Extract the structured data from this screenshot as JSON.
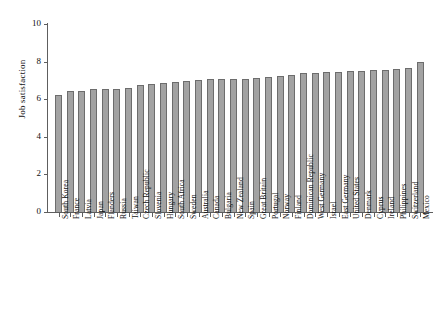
{
  "chart_data": {
    "type": "bar",
    "title": "",
    "subtitle": "",
    "xlabel": "",
    "ylabel": "Job satisfaction",
    "ylim": [
      0,
      10
    ],
    "yticks": [
      0,
      2,
      4,
      6,
      8,
      10
    ],
    "grid": false,
    "legend": null,
    "orientation": "vertical",
    "bar_color": "#a3a3a3",
    "bar_edge_color": "#6d6d6d",
    "axis_color": "#5e5e5e",
    "background_color": "#ffffff",
    "categories": [
      "South Korea",
      "France",
      "Latvia",
      "Japan",
      "Flanders",
      "Russia",
      "Taiwan",
      "Czech Republic",
      "Slovenia",
      "Hungary",
      "South Africa",
      "Sweden",
      "Australia",
      "Canada",
      "Bulgaria",
      "New Zealand",
      "Spain",
      "Great Britain",
      "Portugal",
      "Norway",
      "Finland",
      "Dominican Republic",
      "West Germany",
      "Israel",
      "East Germany",
      "United States",
      "Denmark",
      "Cyprus",
      "Ireland",
      "Philippines",
      "Switzerland",
      "Mexico"
    ],
    "values": [
      6.2,
      6.45,
      6.45,
      6.55,
      6.55,
      6.55,
      6.6,
      6.75,
      6.8,
      6.85,
      6.9,
      6.95,
      7.0,
      7.05,
      7.05,
      7.1,
      7.1,
      7.15,
      7.2,
      7.25,
      7.3,
      7.4,
      7.4,
      7.45,
      7.45,
      7.5,
      7.5,
      7.55,
      7.55,
      7.6,
      7.65,
      8.0
    ]
  }
}
